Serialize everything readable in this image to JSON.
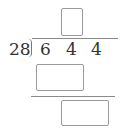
{
  "problem": {
    "type": "long-division",
    "divisor": "28",
    "dividend_digits": [
      "6",
      "4",
      "4"
    ],
    "quotient_box": {
      "value": ""
    },
    "product_box": {
      "value": ""
    },
    "remainder_box": {
      "value": ""
    }
  }
}
